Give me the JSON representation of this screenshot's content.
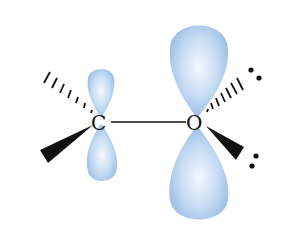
{
  "diagram": {
    "atoms": [
      {
        "symbol": "C",
        "x": 100,
        "y": 122
      },
      {
        "symbol": "O",
        "x": 196,
        "y": 122
      }
    ],
    "bond": {
      "from": "C",
      "to": "O",
      "type": "single"
    },
    "orbitals": [
      {
        "atom": "C",
        "type": "p",
        "size": "small"
      },
      {
        "atom": "O",
        "type": "p",
        "size": "large"
      }
    ],
    "substituents": {
      "C": [
        "hashed-wedge-upper-left",
        "solid-wedge-lower-left"
      ],
      "O": [
        "hashed-wedge-upper-right",
        "solid-wedge-lower-right"
      ]
    },
    "lone_pairs": {
      "O": 2
    },
    "colors": {
      "orbital": "#a9c8ea",
      "orbital_highlight": "#eef5fd",
      "line": "#111111"
    }
  }
}
